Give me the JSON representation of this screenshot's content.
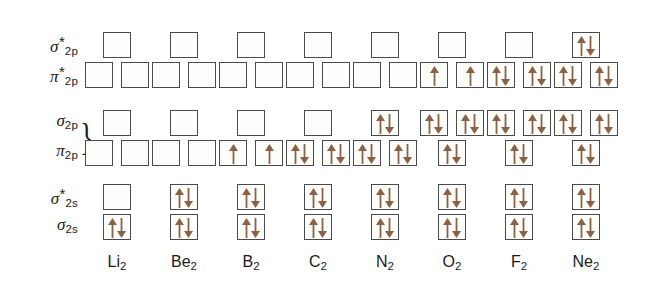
{
  "figure": {
    "arrow_color": "#8B6245",
    "box_border_color": "#4a4a4a",
    "box_fill_color": "#fdfdfb"
  },
  "row_labels": [
    {
      "id": "sigma-star-2p",
      "symbol": "σ",
      "star": "*",
      "sub": "2p"
    },
    {
      "id": "pi-star-2p",
      "symbol": "π",
      "star": "*",
      "sub": "2p"
    },
    {
      "id": "sigma-2p",
      "symbol": "σ",
      "star": "",
      "sub": "2p"
    },
    {
      "id": "pi-2p",
      "symbol": "π",
      "star": "",
      "sub": "2p"
    },
    {
      "id": "sigma-star-2s",
      "symbol": "σ",
      "star": "*",
      "sub": "2s"
    },
    {
      "id": "sigma-2s",
      "symbol": "σ",
      "star": "",
      "sub": "2s"
    }
  ],
  "brace": {
    "glyph": "}"
  },
  "columns": [
    {
      "id": "Li2",
      "element": "Li",
      "sub": "2"
    },
    {
      "id": "Be2",
      "element": "Be",
      "sub": "2"
    },
    {
      "id": "B2",
      "element": "B",
      "sub": "2"
    },
    {
      "id": "C2",
      "element": "C",
      "sub": "2"
    },
    {
      "id": "N2",
      "element": "N",
      "sub": "2"
    },
    {
      "id": "O2",
      "element": "O",
      "sub": "2"
    },
    {
      "id": "F2",
      "element": "F",
      "sub": "2"
    },
    {
      "id": "Ne2",
      "element": "Ne",
      "sub": "2"
    }
  ],
  "chart_data": {
    "type": "table",
    "xlabel": "Molecule",
    "ylabel": "Molecular orbital energy level",
    "categories": [
      "Li2",
      "Be2",
      "B2",
      "C2",
      "N2",
      "O2",
      "F2",
      "Ne2"
    ],
    "orbital_levels": [
      "sigma*2p",
      "pi*2p",
      "sigma2p",
      "pi2p",
      "sigma*2s",
      "sigma2s"
    ],
    "note_ordering": "For Li2 through N2 the sigma2p level lies above pi2p; for O2, F2 and Ne2 the pi2p level lies above sigma2p.",
    "occupancy_legend": {
      "0": "empty box",
      "1": "single up arrow",
      "2": "paired up and down arrows"
    },
    "occupancy": {
      "Li2": {
        "sigma*2p": [
          0
        ],
        "pi*2p": [
          0,
          0
        ],
        "sigma2p": [
          0
        ],
        "pi2p": [
          0,
          0
        ],
        "sigma*2s": [
          0
        ],
        "sigma2s": [
          2
        ]
      },
      "Be2": {
        "sigma*2p": [
          0
        ],
        "pi*2p": [
          0,
          0
        ],
        "sigma2p": [
          0
        ],
        "pi2p": [
          0,
          0
        ],
        "sigma*2s": [
          2
        ],
        "sigma2s": [
          2
        ]
      },
      "B2": {
        "sigma*2p": [
          0
        ],
        "pi*2p": [
          0,
          0
        ],
        "sigma2p": [
          0
        ],
        "pi2p": [
          1,
          1
        ],
        "sigma*2s": [
          2
        ],
        "sigma2s": [
          2
        ]
      },
      "C2": {
        "sigma*2p": [
          0
        ],
        "pi*2p": [
          0,
          0
        ],
        "sigma2p": [
          0
        ],
        "pi2p": [
          2,
          2
        ],
        "sigma*2s": [
          2
        ],
        "sigma2s": [
          2
        ]
      },
      "N2": {
        "sigma*2p": [
          0
        ],
        "pi*2p": [
          0,
          0
        ],
        "sigma2p": [
          2
        ],
        "pi2p": [
          2,
          2
        ],
        "sigma*2s": [
          2
        ],
        "sigma2s": [
          2
        ]
      },
      "O2": {
        "sigma*2p": [
          0
        ],
        "pi*2p": [
          1,
          1
        ],
        "sigma2p": [
          2
        ],
        "pi2p": [
          2,
          2
        ],
        "sigma*2s": [
          2
        ],
        "sigma2s": [
          2
        ]
      },
      "F2": {
        "sigma*2p": [
          0
        ],
        "pi*2p": [
          2,
          2
        ],
        "sigma2p": [
          2
        ],
        "pi2p": [
          2,
          2
        ],
        "sigma*2s": [
          2
        ],
        "sigma2s": [
          2
        ]
      },
      "Ne2": {
        "sigma*2p": [
          2
        ],
        "pi*2p": [
          2,
          2
        ],
        "sigma2p": [
          2
        ],
        "pi2p": [
          2,
          2
        ],
        "sigma*2s": [
          2
        ],
        "sigma2s": [
          2
        ]
      }
    },
    "valence_electron_counts": {
      "Li2": 2,
      "Be2": 4,
      "B2": 6,
      "C2": 8,
      "N2": 10,
      "O2": 12,
      "F2": 14,
      "Ne2": 16
    }
  }
}
